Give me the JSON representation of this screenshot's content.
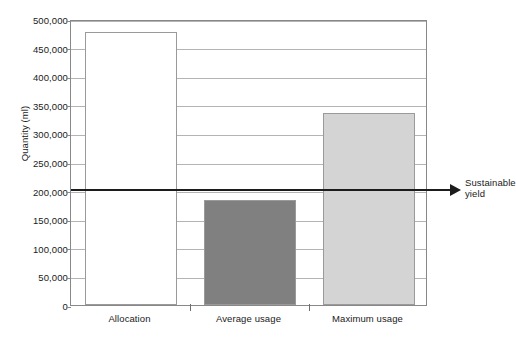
{
  "chart_data": {
    "type": "bar",
    "title": "",
    "xlabel": "",
    "ylabel": "Quantity (ml)",
    "categories": [
      "Allocation",
      "Average usage",
      "Maximum usage"
    ],
    "values": [
      478000,
      183000,
      335000
    ],
    "series": [
      {
        "name": "Quantity",
        "values": [
          478000,
          183000,
          335000
        ],
        "colors": [
          "#ffffff",
          "#808080",
          "#d4d4d4"
        ]
      }
    ],
    "ylim": [
      0,
      500000
    ],
    "yticks": [
      0,
      50000,
      100000,
      150000,
      200000,
      250000,
      300000,
      350000,
      400000,
      450000,
      500000
    ],
    "ytick_labels": [
      "0",
      "50,000",
      "100,000",
      "150,000",
      "200,000",
      "250,000",
      "300,000",
      "350,000",
      "400,000",
      "450,000",
      "500,000"
    ],
    "grid": true,
    "legend": false,
    "legend_position": "none",
    "annotations": [
      {
        "name": "sustainable-yield",
        "label": "Sustainable\nyield",
        "label_line_1": "Sustainable",
        "label_line_2": "yield",
        "value": 205000,
        "style": "horizontal-arrow",
        "color": "#1c1c1c"
      }
    ]
  },
  "colors": {
    "allocation_bar": "#ffffff",
    "average_usage_bar": "#808080",
    "maximum_usage_bar": "#d4d4d4",
    "bar_border": "#9a9a9a",
    "gridline": "#b4b4b4",
    "axis": "#888888",
    "annotation": "#1c1c1c",
    "text": "#1a1a1a",
    "background": "#ffffff"
  }
}
